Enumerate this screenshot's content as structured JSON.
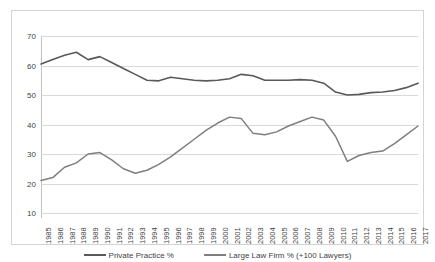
{
  "chart_data": {
    "type": "line",
    "title": "",
    "xlabel": "",
    "ylabel": "",
    "ylim": [
      10,
      70
    ],
    "yticks": [
      70,
      60,
      50,
      40,
      30,
      20,
      10
    ],
    "grid": true,
    "legend_position": "bottom",
    "x": [
      1985,
      1986,
      1987,
      1988,
      1989,
      1990,
      1991,
      1992,
      1993,
      1994,
      1995,
      1996,
      1997,
      1998,
      1999,
      2000,
      2001,
      2002,
      2003,
      2004,
      2005,
      2006,
      2007,
      2008,
      2009,
      2010,
      2011,
      2012,
      2013,
      2014,
      2015,
      2016,
      2017
    ],
    "series": [
      {
        "name": "Private Practice %",
        "color": "#595959",
        "values": [
          60.5,
          62.0,
          63.5,
          64.5,
          62.0,
          63.0,
          61.0,
          59.0,
          57.0,
          55.0,
          54.8,
          56.0,
          55.5,
          55.0,
          54.8,
          55.0,
          55.5,
          57.0,
          56.5,
          55.0,
          55.0,
          55.0,
          55.2,
          55.0,
          54.0,
          51.0,
          50.0,
          50.2,
          50.8,
          51.0,
          51.5,
          52.5,
          54.0
        ]
      },
      {
        "name": "Large Law Firm % (+100 Lawyers)",
        "color": "#7f7f7f",
        "values": [
          21.0,
          22.0,
          25.5,
          27.0,
          30.0,
          30.5,
          28.0,
          25.0,
          23.5,
          24.5,
          26.5,
          29.0,
          32.0,
          35.0,
          38.0,
          40.5,
          42.5,
          42.0,
          37.0,
          36.5,
          37.5,
          39.5,
          41.0,
          42.5,
          41.5,
          36.0,
          27.5,
          29.5,
          30.5,
          31.0,
          33.5,
          36.5,
          39.5
        ]
      }
    ]
  },
  "legend": {
    "items": [
      {
        "label": "Private Practice %"
      },
      {
        "label": "Large Law Firm % (+100 Lawyers)"
      }
    ]
  }
}
